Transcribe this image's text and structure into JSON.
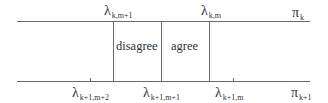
{
  "diagram": {
    "top_axis": {
      "name": "π_k",
      "symbol": "π",
      "subscript": "k",
      "markers": [
        {
          "symbol": "λ",
          "subscript": "k,m+1"
        },
        {
          "symbol": "λ",
          "subscript": "k,m"
        }
      ]
    },
    "bottom_axis": {
      "name": "π_{k+1}",
      "symbol": "π",
      "subscript": "k+1",
      "markers": [
        {
          "symbol": "λ",
          "subscript": "k+1,m+2"
        },
        {
          "symbol": "λ",
          "subscript": "k+1,m+1"
        },
        {
          "symbol": "λ",
          "subscript": "k+1,m"
        }
      ]
    },
    "regions": [
      {
        "label": "disagree"
      },
      {
        "label": "agree"
      }
    ],
    "colors": {
      "line": "#6a6a6a",
      "text": "#333333"
    }
  }
}
